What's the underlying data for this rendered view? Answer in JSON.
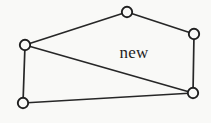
{
  "figure": {
    "background_color": "#f9f9f7",
    "stroke_color": "#272727",
    "vertex_fill_color": "#f9f9f7",
    "vertex_stroke_color": "#1f1f1f",
    "width": 211,
    "height": 123
  },
  "labels": {
    "new_region": "new"
  },
  "chart_data": {
    "type": "scatter",
    "title": "",
    "xlabel": "",
    "ylabel": "",
    "grid": false,
    "legend": "none",
    "xlim": [
      0,
      211
    ],
    "ylim": [
      0,
      123
    ],
    "annotations": [
      {
        "text": "new",
        "x": 134,
        "y": 52
      }
    ],
    "nodes": [
      {
        "name": "top",
        "x": 127,
        "y": 12,
        "r": 5.2
      },
      {
        "name": "right",
        "x": 194,
        "y": 34,
        "r": 5.2
      },
      {
        "name": "left",
        "x": 25,
        "y": 45,
        "r": 5.2
      },
      {
        "name": "bottom-right",
        "x": 193,
        "y": 93,
        "r": 5.2
      },
      {
        "name": "bottom-left",
        "x": 23,
        "y": 103,
        "r": 5.2
      }
    ],
    "edges": [
      {
        "name": "left-to-top",
        "x1": 25,
        "y1": 45,
        "x2": 127,
        "y2": 12
      },
      {
        "name": "top-to-right",
        "x1": 127,
        "y1": 12,
        "x2": 194,
        "y2": 34
      },
      {
        "name": "right-to-bottom-right",
        "x1": 194,
        "y1": 34,
        "x2": 193,
        "y2": 93
      },
      {
        "name": "bottom-right-to-bottom-left",
        "x1": 193,
        "y1": 93,
        "x2": 23,
        "y2": 103
      },
      {
        "name": "bottom-left-to-left",
        "x1": 23,
        "y1": 103,
        "x2": 25,
        "y2": 45
      }
    ],
    "chords": [
      {
        "name": "left-to-bottom-right",
        "x1": 25,
        "y1": 45,
        "x2": 193,
        "y2": 93
      }
    ]
  }
}
